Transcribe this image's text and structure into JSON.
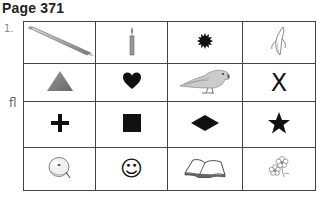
{
  "page": {
    "title": "Page 371",
    "exercise_number": "1.",
    "side_label": "fl"
  },
  "grid": {
    "rows": [
      [
        {
          "name": "pencil",
          "icon": "pencil-icon"
        },
        {
          "name": "candle",
          "icon": "candle-icon"
        },
        {
          "name": "sun-burst",
          "icon": "starburst-icon"
        },
        {
          "name": "banana",
          "icon": "banana-icon"
        }
      ],
      [
        {
          "name": "triangle",
          "icon": "triangle-icon"
        },
        {
          "name": "heart",
          "icon": "heart-icon"
        },
        {
          "name": "parrot",
          "icon": "parrot-icon"
        },
        {
          "name": "x",
          "icon": "x-mark-icon",
          "text": "X"
        }
      ],
      [
        {
          "name": "plus",
          "icon": "plus-icon"
        },
        {
          "name": "square",
          "icon": "square-icon"
        },
        {
          "name": "diamond",
          "icon": "diamond-icon"
        },
        {
          "name": "star",
          "icon": "star-icon"
        }
      ],
      [
        {
          "name": "apple",
          "icon": "apple-icon"
        },
        {
          "name": "smiley",
          "icon": "smiley-icon",
          "text": "☺"
        },
        {
          "name": "book",
          "icon": "book-icon"
        },
        {
          "name": "flowers",
          "icon": "flowers-icon"
        }
      ]
    ]
  },
  "colors": {
    "grid_line": "#444444",
    "triangle": "#7a7a7a",
    "solid": "#111111"
  }
}
